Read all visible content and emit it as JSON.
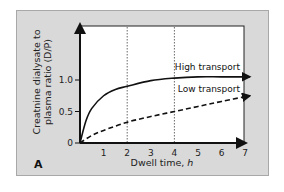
{
  "panel_label": "A",
  "chart_data": {
    "type": "line",
    "title": "",
    "xlabel": "Dwell time, h",
    "ylabel_line1": "Creatnine dialysate to",
    "ylabel_line2": "plasma ratio (D/P)",
    "xlim": [
      0,
      7.3
    ],
    "ylim": [
      0,
      1.5
    ],
    "x_ticks": [
      "1",
      "2",
      "3",
      "4",
      "5",
      "6",
      "7"
    ],
    "y_ticks": [
      "0",
      "0.5",
      "1.0"
    ],
    "y_tick_values": [
      0,
      0.5,
      1.0
    ],
    "grid": false,
    "reference_lines": [
      {
        "x": 2,
        "style": "dotted"
      },
      {
        "x": 4,
        "style": "dotted"
      }
    ],
    "series": [
      {
        "name": "High transport",
        "style": "solid",
        "x": [
          0,
          0.25,
          0.5,
          1,
          1.5,
          2,
          3,
          4,
          5,
          6,
          7.2
        ],
        "y": [
          0,
          0.35,
          0.55,
          0.75,
          0.85,
          0.9,
          0.99,
          1.03,
          1.05,
          1.05,
          1.05
        ]
      },
      {
        "name": "Low transport",
        "style": "dashed",
        "x": [
          0,
          0.5,
          1,
          2,
          3,
          4,
          5,
          6,
          7.2
        ],
        "y": [
          0,
          0.12,
          0.2,
          0.33,
          0.42,
          0.5,
          0.58,
          0.66,
          0.75
        ]
      }
    ],
    "legend": {
      "position": "inline-right",
      "entries": [
        "High transport",
        "Low transport"
      ]
    }
  }
}
